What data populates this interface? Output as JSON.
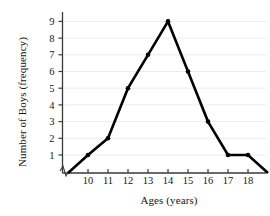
{
  "chart_data": {
    "type": "line",
    "title": "",
    "xlabel": "Ages (years)",
    "ylabel": "Number of Boys (frequency)",
    "x": [
      9,
      10,
      11,
      12,
      13,
      14,
      15,
      16,
      17,
      18,
      19
    ],
    "values": [
      0,
      1,
      2,
      5,
      7,
      9,
      6,
      3,
      1,
      1,
      0
    ],
    "categories": [
      "9",
      "10",
      "11",
      "12",
      "13",
      "14",
      "15",
      "16",
      "17",
      "18",
      "19"
    ],
    "xticks": [
      10,
      11,
      12,
      13,
      14,
      15,
      16,
      17,
      18
    ],
    "xtick_labels": [
      "10",
      "11",
      "12",
      "13",
      "14",
      "15",
      "16",
      "17",
      "18"
    ],
    "yticks": [
      1,
      2,
      3,
      4,
      5,
      6,
      7,
      8,
      9
    ],
    "ytick_labels": [
      "1",
      "2",
      "3",
      "4",
      "5",
      "6",
      "7",
      "8",
      "9"
    ],
    "xlim": [
      8.4,
      19.3
    ],
    "ylim": [
      0,
      9.6
    ],
    "grid": "horizontal",
    "grid_color": "#ececec",
    "line_color": "#000000",
    "marker": "dot",
    "axis_break": "y-axis-near-origin",
    "legend": "none"
  },
  "colors": {
    "background": "#ffffff",
    "axis": "#3a3a3a",
    "text": "#161616",
    "series": "#000000",
    "grid": "#ececec"
  }
}
